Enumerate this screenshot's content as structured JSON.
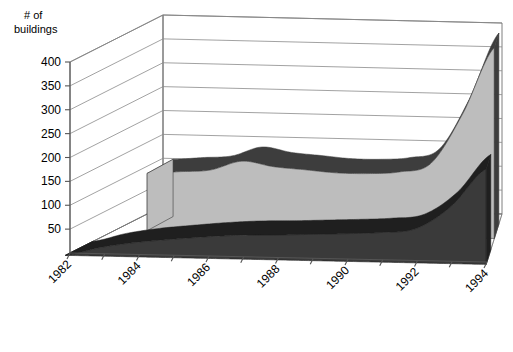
{
  "chart_data": {
    "type": "area",
    "title": "",
    "subtitle": "",
    "ylabel": "# of buildings",
    "xlabel": "",
    "ylim": [
      0,
      400
    ],
    "grid": true,
    "legend": "none",
    "projection": "3d-ribbon",
    "yticks": [
      50,
      100,
      150,
      200,
      250,
      300,
      350,
      400
    ],
    "ytick_labels": [
      "50",
      "100",
      "150",
      "200",
      "250",
      "300",
      "350",
      "400"
    ],
    "xticks": [
      1982,
      1983,
      1984,
      1985,
      1986,
      1987,
      1988,
      1989,
      1990,
      1991,
      1992,
      1993,
      1994
    ],
    "xtick_labels": [
      "1982",
      "1984",
      "1986",
      "1988",
      "1990",
      "1992",
      "1994"
    ],
    "xtick_labels_shown": [
      1982,
      1984,
      1986,
      1988,
      1990,
      1992,
      1994
    ],
    "x": [
      1982,
      1983,
      1984,
      1985,
      1986,
      1987,
      1988,
      1989,
      1990,
      1991,
      1992,
      1993,
      1994
    ],
    "series": [
      {
        "name": "back-series",
        "color": "#bdbdbd",
        "edge_color": "#3d3d3d",
        "values": [
          null,
          120,
          125,
          130,
          150,
          140,
          135,
          130,
          130,
          135,
          155,
          260,
          400
        ]
      },
      {
        "name": "front-series",
        "color": "#3a3a3a",
        "edge_color": "#1f1f1f",
        "values": [
          0,
          18,
          30,
          38,
          45,
          50,
          52,
          55,
          58,
          62,
          72,
          120,
          200
        ]
      }
    ]
  },
  "labels": {
    "ylabel_line1": "# of",
    "ylabel_line2": "buildings"
  },
  "colors": {
    "back_fill": "#bdbdbd",
    "back_edge": "#3d3d3d",
    "front_fill": "#3a3a3a",
    "front_edge": "#1a1a1a",
    "grid": "#8a8a8a",
    "axis": "#555555",
    "background": "#ffffff"
  }
}
